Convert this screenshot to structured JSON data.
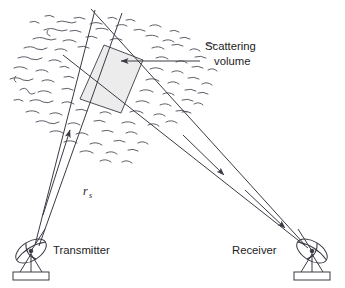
{
  "figure": {
    "labels": {
      "scattering_volume_line1": "Scattering",
      "scattering_volume_line2": "volume",
      "transmitter": "Transmitter",
      "receiver": "Receiver",
      "path_length_symbol": "r",
      "path_length_subscript": "s"
    },
    "colors": {
      "line": "#3a3a44",
      "scatter_volume_fill": "#ececec",
      "turbulence": "#555560",
      "text": "#1c1c1c",
      "background": "#ffffff"
    },
    "geometry": {
      "transmitter_dish_center": [
        31,
        251
      ],
      "receiver_dish_center": [
        312,
        251
      ],
      "scatter_volume_vertices": [
        [
          104,
          45
        ],
        [
          143,
          60
        ],
        [
          121,
          113
        ],
        [
          80,
          99
        ]
      ],
      "leader_line_from": [
        200,
        61
      ],
      "leader_line_to": [
        121,
        61
      ],
      "transmit_beam_arrow": "up-right",
      "receive_beam_arrows": 2,
      "turbulence_dash_count": 96
    }
  }
}
